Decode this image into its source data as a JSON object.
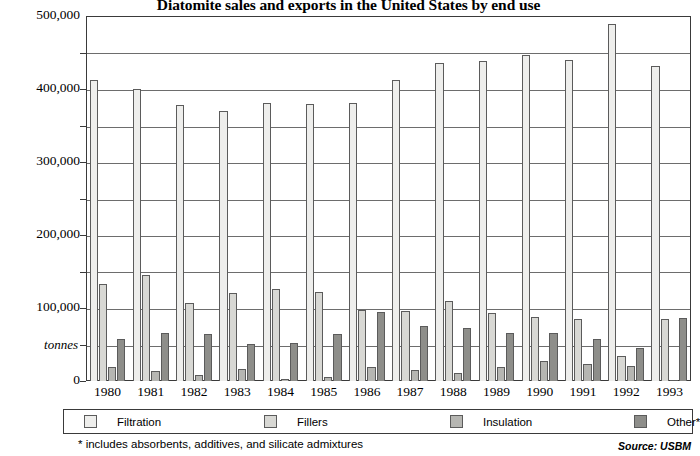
{
  "chart_data": {
    "type": "bar",
    "title": "Diatomite sales and exports in the United States by end use",
    "xlabel": "",
    "ylabel": "tonnes",
    "ylim": [
      0,
      500000
    ],
    "ytick_labels": [
      "0",
      "100,000",
      "200,000",
      "300,000",
      "400,000",
      "500,000"
    ],
    "ytick_values": [
      0,
      100000,
      200000,
      300000,
      400000,
      500000
    ],
    "minor_gridline_values": [
      50000,
      150000,
      250000,
      350000,
      450000
    ],
    "grid": true,
    "legend_position": "bottom",
    "categories": [
      "1980",
      "1981",
      "1982",
      "1983",
      "1984",
      "1985",
      "1986",
      "1987",
      "1988",
      "1989",
      "1990",
      "1991",
      "1992",
      "1993"
    ],
    "series": [
      {
        "name": "Filtration",
        "color": "#eeeeec",
        "values": [
          412000,
          400000,
          378000,
          370000,
          381000,
          379000,
          381000,
          412000,
          435000,
          439000,
          447000,
          440000,
          489000,
          431000
        ]
      },
      {
        "name": "Fillers",
        "color": "#d8d8d4",
        "values": [
          133000,
          145000,
          107000,
          120000,
          126000,
          122000,
          97000,
          96000,
          109000,
          93000,
          88000,
          85000,
          34000,
          85000
        ]
      },
      {
        "name": "Insulation",
        "color": "#b6b6b2",
        "values": [
          19000,
          14000,
          8000,
          17000,
          3000,
          5000,
          19000,
          15000,
          11000,
          19000,
          27000,
          23000,
          21000,
          2000
        ]
      },
      {
        "name": "Other*",
        "color": "#8e8e8a",
        "values": [
          58000,
          66000,
          64000,
          51000,
          52000,
          64000,
          95000,
          76000,
          73000,
          66000,
          66000,
          58000,
          45000,
          86000
        ]
      }
    ],
    "footnote": "* includes absorbents, additives, and silicate admixtures",
    "source": "Source: USBM"
  },
  "legend": {
    "items": [
      {
        "label": "Filtration",
        "swatch": "s0"
      },
      {
        "label": "Fillers",
        "swatch": "s1"
      },
      {
        "label": "Insulation",
        "swatch": "s2"
      },
      {
        "label": "Other*",
        "swatch": "s3"
      }
    ]
  }
}
